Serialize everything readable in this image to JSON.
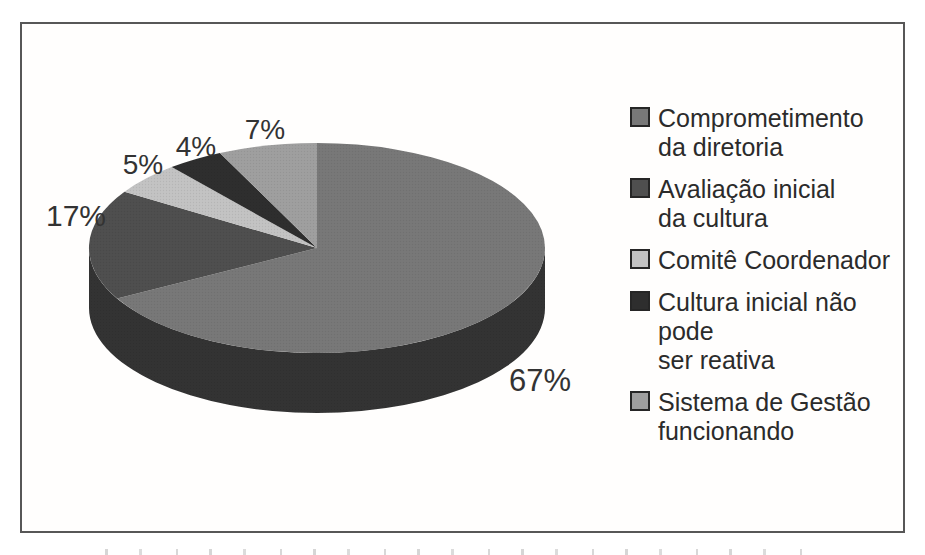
{
  "figure": {
    "background": "#ffffff",
    "frame_border_color": "#575757"
  },
  "chart_data": {
    "type": "pie",
    "style": "3d-pie",
    "title": "",
    "categories": [
      "Comprometimento da diretoria",
      "Avaliação inicial da cultura",
      "Comitê Coordenador",
      "Cultura inicial não pode ser reativa",
      "Sistema de Gestão funcionando"
    ],
    "values": [
      67,
      17,
      5,
      4,
      7
    ],
    "unit": "%",
    "slice_labels": [
      "67%",
      "17%",
      "5%",
      "4%",
      "7%"
    ],
    "colors": [
      "#787878",
      "#4f4f4f",
      "#c3c3c3",
      "#2e2e2e",
      "#9f9f9f"
    ],
    "side_color": "#333333",
    "start_angle_deg": 0,
    "direction": "clockwise",
    "legend_position": "right",
    "label_color": "#333333"
  },
  "legend": {
    "items": [
      {
        "lines": [
          "Comprometimento",
          "da diretoria"
        ],
        "color": "#787878"
      },
      {
        "lines": [
          "Avaliação inicial",
          "da cultura"
        ],
        "color": "#4f4f4f"
      },
      {
        "lines": [
          "Comitê Coordenador"
        ],
        "color": "#c3c3c3"
      },
      {
        "lines": [
          "Cultura inicial não pode",
          "ser reativa"
        ],
        "color": "#2e2e2e"
      },
      {
        "lines": [
          "Sistema de Gestão",
          "funcionando"
        ],
        "color": "#9f9f9f"
      }
    ]
  }
}
